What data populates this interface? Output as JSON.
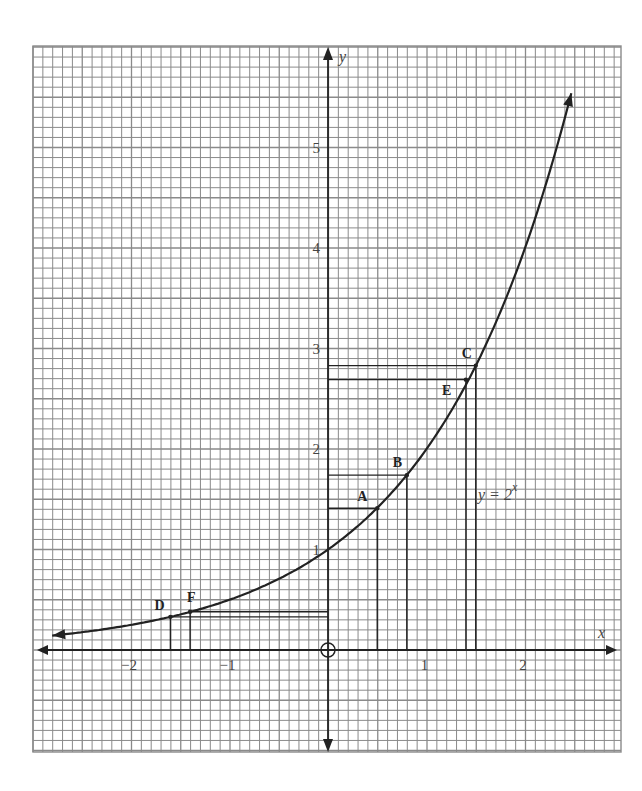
{
  "chart_data": {
    "type": "line",
    "title": "",
    "function_label": "y = 2^x",
    "function_label_base": "y = 2",
    "function_label_exp": "x",
    "xlabel": "x",
    "ylabel": "y",
    "origin_label": "O",
    "xlim": [
      -2.95,
      2.95
    ],
    "ylim": [
      -1.0,
      6.0
    ],
    "grid": true,
    "grid_minor_step": 0.1,
    "x_ticks": [
      {
        "value": -2,
        "label": "−2"
      },
      {
        "value": -1,
        "label": "−1"
      },
      {
        "value": 1,
        "label": "1"
      },
      {
        "value": 2,
        "label": "2"
      }
    ],
    "y_ticks": [
      {
        "value": 1,
        "label": "1"
      },
      {
        "value": 2,
        "label": "2"
      },
      {
        "value": 3,
        "label": "3"
      },
      {
        "value": 4,
        "label": "4"
      },
      {
        "value": 5,
        "label": "5"
      }
    ],
    "series": [
      {
        "name": "y = 2^x",
        "x_range": [
          -2.8,
          2.47
        ],
        "x": [
          -2.8,
          -2.5,
          -2,
          -1.6,
          -1.4,
          -1,
          -0.5,
          0,
          0.5,
          0.8,
          1,
          1.42,
          1.5,
          2,
          2.47
        ],
        "y": [
          0.14,
          0.18,
          0.25,
          0.33,
          0.38,
          0.5,
          0.71,
          1,
          1.41,
          1.74,
          2,
          2.68,
          2.83,
          4,
          5.54
        ]
      }
    ],
    "points": [
      {
        "label": "A",
        "x": 0.5,
        "y": 1.41
      },
      {
        "label": "B",
        "x": 0.8,
        "y": 1.74
      },
      {
        "label": "C",
        "x": 1.5,
        "y": 2.83
      },
      {
        "label": "D",
        "x": -1.6,
        "y": 0.33
      },
      {
        "label": "E",
        "x": 1.4,
        "y": 2.69
      },
      {
        "label": "F",
        "x": -1.4,
        "y": 0.38
      }
    ]
  },
  "colors": {
    "grid": "#8a8a8a",
    "axis": "#222222",
    "curve": "#222222",
    "background": "#ffffff"
  }
}
